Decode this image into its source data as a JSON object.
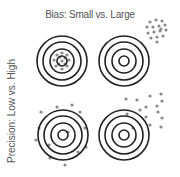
{
  "diagram": {
    "title": "Bias: Small vs. Large",
    "ylabel": "Precision: Low vs. High",
    "colors": {
      "ring": "#222222",
      "dot": "#8a8a8a",
      "text": "#555555"
    },
    "targets": [
      {
        "id": "small-bias-high-precision",
        "cx": 62,
        "cy": 61,
        "radii": [
          25,
          19,
          12,
          5
        ]
      },
      {
        "id": "large-bias-high-precision",
        "cx": 124,
        "cy": 61,
        "radii": [
          25,
          19,
          12,
          5
        ]
      },
      {
        "id": "small-bias-low-precision",
        "cx": 63,
        "cy": 135,
        "radii": [
          25,
          19,
          12,
          5
        ]
      },
      {
        "id": "large-bias-low-precision",
        "cx": 124,
        "cy": 135,
        "radii": [
          25,
          19,
          12,
          5
        ]
      }
    ],
    "shots": [
      {
        "target": 0,
        "points": [
          [
            62,
            53
          ],
          [
            67,
            55
          ],
          [
            69,
            60
          ],
          [
            67,
            66
          ],
          [
            62,
            69
          ],
          [
            56,
            66
          ],
          [
            54,
            60
          ],
          [
            57,
            55
          ],
          [
            60,
            57
          ],
          [
            65,
            58
          ],
          [
            65,
            64
          ],
          [
            59,
            64
          ],
          [
            62,
            61
          ]
        ]
      },
      {
        "target": 1,
        "points": [
          [
            150,
            22
          ],
          [
            156,
            20
          ],
          [
            162,
            21
          ],
          [
            147,
            27
          ],
          [
            153,
            27
          ],
          [
            159,
            26
          ],
          [
            165,
            25
          ],
          [
            148,
            33
          ],
          [
            154,
            32
          ],
          [
            160,
            31
          ],
          [
            166,
            30
          ],
          [
            151,
            38
          ],
          [
            157,
            37
          ],
          [
            163,
            36
          ],
          [
            157,
            42
          ],
          [
            161,
            29
          ]
        ]
      },
      {
        "target": 2,
        "points": [
          [
            41,
            112
          ],
          [
            57,
            107
          ],
          [
            72,
            105
          ],
          [
            80,
            112
          ],
          [
            39,
            128
          ],
          [
            36,
            140
          ],
          [
            49,
            145
          ],
          [
            85,
            128
          ],
          [
            86,
            147
          ],
          [
            78,
            152
          ],
          [
            50,
            158
          ],
          [
            65,
            165
          ],
          [
            68,
            132
          ]
        ]
      },
      {
        "target": 3,
        "points": [
          [
            126,
            99
          ],
          [
            137,
            100
          ],
          [
            150,
            96
          ],
          [
            161,
            94
          ],
          [
            146,
            107
          ],
          [
            157,
            106
          ],
          [
            162,
            101
          ],
          [
            140,
            110
          ],
          [
            158,
            112
          ],
          [
            127,
            114
          ],
          [
            146,
            117
          ],
          [
            162,
            118
          ],
          [
            150,
            125
          ],
          [
            161,
            127
          ],
          [
            133,
            128
          ]
        ]
      }
    ]
  }
}
